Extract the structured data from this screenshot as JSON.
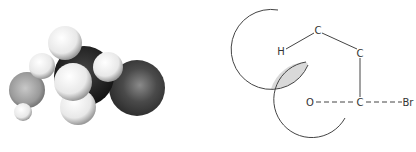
{
  "figure": {
    "left_panel": {
      "type": "space-filling molecular model",
      "spheres": [
        {
          "role": "oxygen",
          "cx": 27,
          "cy": 90,
          "r": 18,
          "shade": "mid-gray"
        },
        {
          "role": "bromine",
          "cx": 137,
          "cy": 88,
          "r": 28,
          "shade": "dark-gray"
        },
        {
          "role": "carbon",
          "cx": 82,
          "cy": 76,
          "r": 30,
          "shade": "black"
        },
        {
          "role": "hydrogen",
          "cx": 42,
          "cy": 66,
          "r": 13,
          "shade": "white"
        },
        {
          "role": "hydrogen",
          "cx": 65,
          "cy": 43,
          "r": 17,
          "shade": "white"
        },
        {
          "role": "hydrogen",
          "cx": 108,
          "cy": 67,
          "r": 15,
          "shade": "white"
        },
        {
          "role": "hydrogen",
          "cx": 78,
          "cy": 107,
          "r": 18,
          "shade": "white"
        },
        {
          "role": "hydrogen",
          "cx": 73,
          "cy": 82,
          "r": 19,
          "shade": "white"
        },
        {
          "role": "hydrogen",
          "cx": 23,
          "cy": 112,
          "r": 9,
          "shade": "white"
        }
      ]
    },
    "right_panel": {
      "type": "structural schematic",
      "atoms": [
        {
          "id": "c1",
          "label": "C",
          "x": 318,
          "y": 30
        },
        {
          "id": "h",
          "label": "H",
          "x": 281,
          "y": 51
        },
        {
          "id": "c2",
          "label": "C",
          "x": 360,
          "y": 53
        },
        {
          "id": "c3",
          "label": "C",
          "x": 360,
          "y": 102
        },
        {
          "id": "o",
          "label": "O",
          "x": 310,
          "y": 102
        },
        {
          "id": "br",
          "label": "Br",
          "x": 408,
          "y": 102
        }
      ],
      "bonds": [
        {
          "from": "h",
          "to": "c1",
          "style": "solid"
        },
        {
          "from": "c1",
          "to": "c2",
          "style": "solid"
        },
        {
          "from": "c2",
          "to": "c3",
          "style": "solid"
        },
        {
          "from": "o",
          "to": "c3",
          "style": "dashed"
        },
        {
          "from": "c3",
          "to": "br",
          "style": "dashed"
        }
      ],
      "orbital_arcs": 2,
      "overlap_region": "shaded"
    },
    "colors": {
      "line": "#444444",
      "overlap_fill": "#d9d9d9",
      "background": "#ffffff"
    }
  }
}
